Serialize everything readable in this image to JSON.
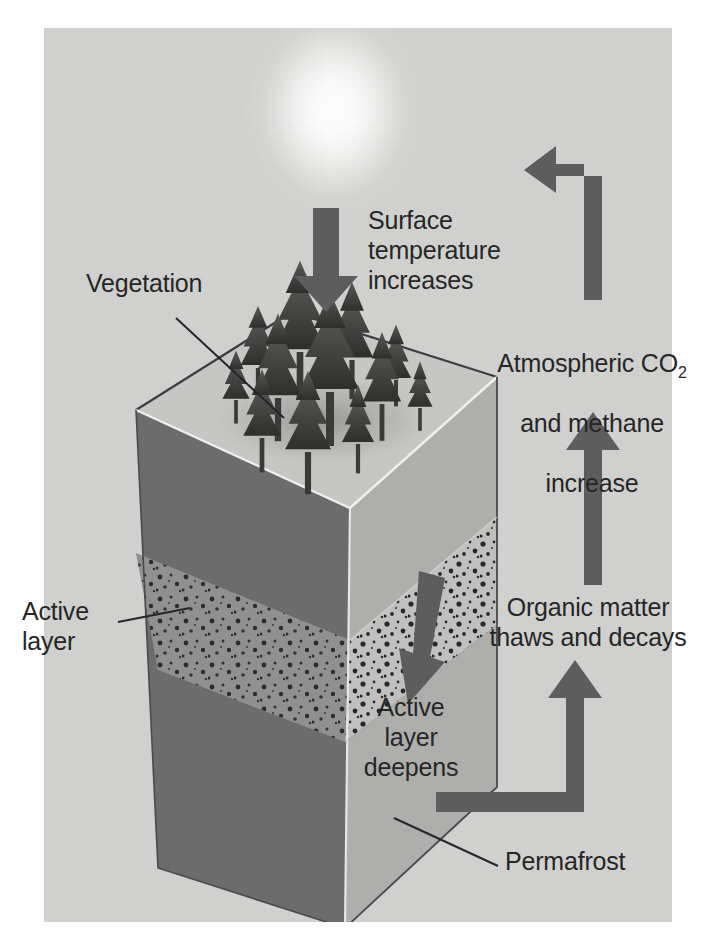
{
  "figure": {
    "background_color": "#d4d4d2",
    "ink_color": "#4d4d4d",
    "text_color": "#262626"
  },
  "labels": {
    "vegetation": "Vegetation",
    "surface_temperature": "Surface\ntemperature\nincreases",
    "atmospheric_line1": "Atmospheric CO",
    "atmospheric_sub": "2",
    "atmospheric_line2": "and methane",
    "atmospheric_line3": "increase",
    "organic_matter": "Organic matter\nthaws and decays",
    "active_layer": "Active\nlayer",
    "active_layer_deepens": "Active\nlayer\ndeepens",
    "permafrost": "Permafrost"
  },
  "icons": {
    "sun": "sun-icon",
    "down_arrow": "down-arrow-icon",
    "up_arrow": "up-arrow-icon",
    "elbow_arrow_up_left": "elbow-arrow-up-left-icon",
    "elbow_arrow_right_up": "elbow-arrow-right-up-icon",
    "thaw_arrow": "thaw-down-arrow-icon",
    "forest": "conifer-forest-icon",
    "block": "soil-block-icon"
  },
  "block": {
    "top_face_color": "#c2c2c0",
    "left_face_color": "#6f6f6f",
    "right_face_color": "#a6a6a4",
    "active_layer_left_color": "#8f8f8f",
    "active_layer_right_color": "#bdbdbb"
  },
  "diagram_flow": [
    "Surface temperature increases",
    "Active layer deepens",
    "Organic matter thaws and decays",
    "Atmospheric CO2 and methane increase",
    "Surface temperature increases"
  ]
}
